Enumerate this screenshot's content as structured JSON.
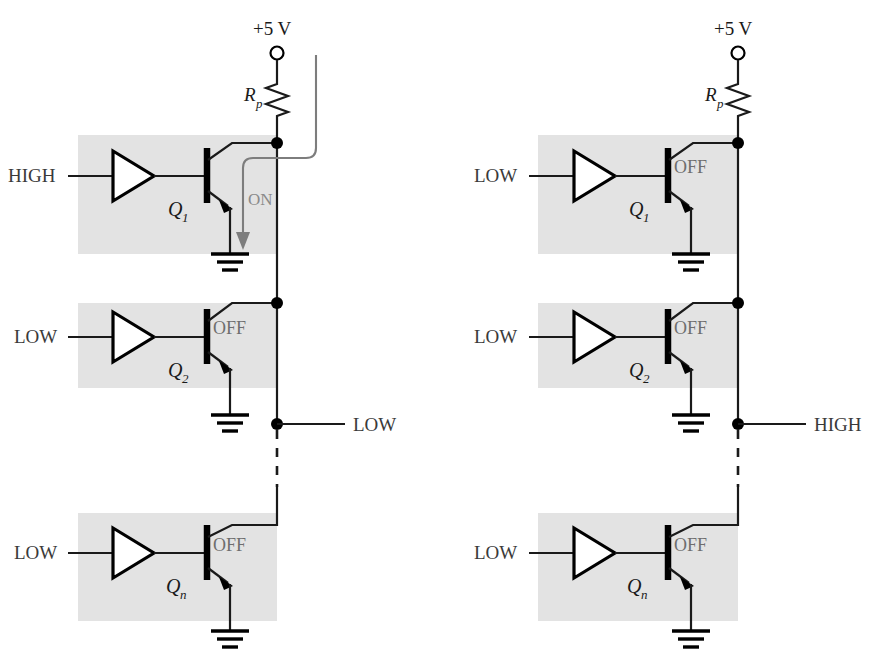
{
  "figure": {
    "colors": {
      "band": "#e3e3e3",
      "wire": "#1a1a1a",
      "text": "#3a3a3a",
      "state_text": "#6e6e6e",
      "current_path": "#7d7d7d",
      "background": "#ffffff"
    }
  },
  "panels": [
    {
      "id": "left",
      "supply_label": "+5 V",
      "resistor_label": "R",
      "resistor_sub": "p",
      "bus_output_label": "LOW",
      "current_label": "ON",
      "stages": [
        {
          "input_label": "HIGH",
          "transistor_label": "Q",
          "transistor_sub": "1",
          "state": "ON"
        },
        {
          "input_label": "LOW",
          "transistor_label": "Q",
          "transistor_sub": "2",
          "state": "OFF"
        },
        {
          "input_label": "LOW",
          "transistor_label": "Q",
          "transistor_sub": "n",
          "state": "OFF"
        }
      ]
    },
    {
      "id": "right",
      "supply_label": "+5 V",
      "resistor_label": "R",
      "resistor_sub": "p",
      "bus_output_label": "HIGH",
      "current_label": "",
      "stages": [
        {
          "input_label": "LOW",
          "transistor_label": "Q",
          "transistor_sub": "1",
          "state": "OFF"
        },
        {
          "input_label": "LOW",
          "transistor_label": "Q",
          "transistor_sub": "2",
          "state": "OFF"
        },
        {
          "input_label": "LOW",
          "transistor_label": "Q",
          "transistor_sub": "n",
          "state": "OFF"
        }
      ]
    }
  ]
}
